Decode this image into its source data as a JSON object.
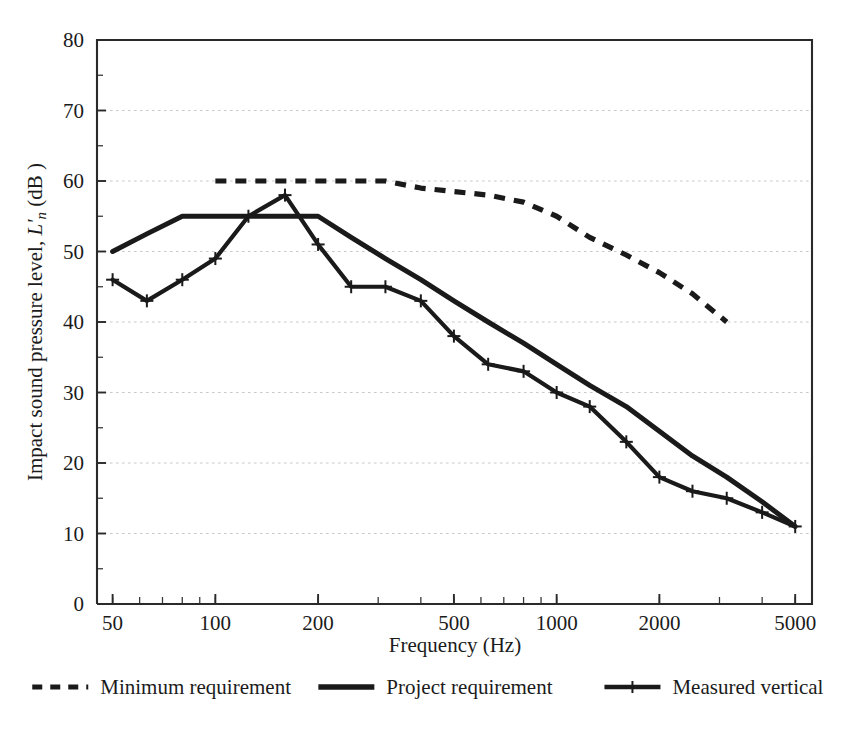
{
  "chart_data": {
    "type": "line",
    "title": "",
    "xlabel": "Frequency (Hz)",
    "ylabel_prefix": "Impact sound pressure level, ",
    "ylabel_symbol": "L'",
    "ylabel_symbol_sub": "n",
    "ylabel_suffix": " (dB )",
    "ylabel_full": "Impact sound pressure level, L'n (dB )",
    "xscale": "log",
    "yscale": "linear",
    "xlim": [
      45,
      5600
    ],
    "ylim": [
      0,
      80
    ],
    "grid": "horizontal-dotted",
    "legend_position": "below-axes",
    "x_tick_labels": [
      "50",
      "100",
      "200",
      "500",
      "1000",
      "2000",
      "5000"
    ],
    "x_tick_values": [
      50,
      100,
      200,
      500,
      1000,
      2000,
      5000
    ],
    "y_tick_labels": [
      "0",
      "10",
      "20",
      "30",
      "40",
      "50",
      "60",
      "70",
      "80"
    ],
    "y_tick_values": [
      0,
      10,
      20,
      30,
      40,
      50,
      60,
      70,
      80
    ],
    "y_minor_step": 5,
    "series": [
      {
        "name": "Minimum requirement",
        "style": "dashed",
        "markers": "none",
        "color": "#1a1a1a",
        "x": [
          100,
          125,
          160,
          200,
          250,
          315,
          400,
          500,
          630,
          800,
          1000,
          1250,
          1600,
          2000,
          2500,
          3150
        ],
        "values": [
          60,
          60,
          60,
          60,
          60,
          60,
          59,
          58.5,
          58,
          57,
          55,
          52,
          49.5,
          47,
          44,
          40
        ]
      },
      {
        "name": "Project requirement",
        "style": "solid",
        "markers": "none",
        "color": "#1a1a1a",
        "x": [
          50,
          63,
          80,
          100,
          125,
          160,
          200,
          250,
          315,
          400,
          500,
          630,
          800,
          1000,
          1250,
          1600,
          2000,
          2500,
          3150,
          4000,
          5000
        ],
        "values": [
          50,
          52.5,
          55,
          55,
          55,
          55,
          55,
          52,
          49,
          46,
          43,
          40,
          37,
          34,
          31,
          28,
          24.5,
          21,
          18,
          14.5,
          11
        ]
      },
      {
        "name": "Measured vertical",
        "style": "solid",
        "markers": "plus",
        "color": "#1a1a1a",
        "x": [
          50,
          63,
          80,
          100,
          125,
          160,
          200,
          250,
          315,
          400,
          500,
          630,
          800,
          1000,
          1250,
          1600,
          2000,
          2500,
          3150,
          4000,
          5000
        ],
        "values": [
          46,
          43,
          46,
          49,
          55,
          58,
          51,
          45,
          45,
          43,
          38,
          34,
          33,
          30,
          28,
          23,
          18,
          16,
          15,
          13,
          11
        ]
      }
    ]
  },
  "legend": {
    "items": [
      {
        "label": "Minimum requirement",
        "style": "dashed"
      },
      {
        "label": "Project requirement",
        "style": "solid"
      },
      {
        "label": "Measured vertical",
        "style": "solid-plus"
      }
    ]
  }
}
